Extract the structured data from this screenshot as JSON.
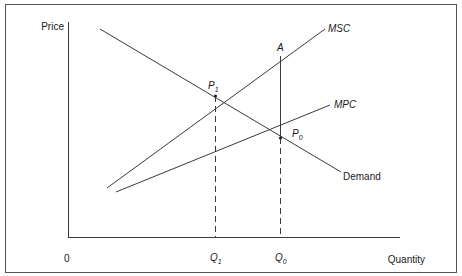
{
  "diagram": {
    "type": "externality-supply-demand",
    "axes": {
      "y_label": "Price",
      "x_label": "Quantity",
      "origin_label": "0"
    },
    "curves": [
      {
        "id": "demand",
        "label": "Demand",
        "italic": false
      },
      {
        "id": "msc",
        "label": "MSC",
        "italic": true
      },
      {
        "id": "mpc",
        "label": "MPC",
        "italic": true
      }
    ],
    "points": {
      "p1": {
        "main": "P",
        "sub": "1",
        "meaning": "intersection of Demand and MSC"
      },
      "p0": {
        "main": "P",
        "sub": "0",
        "meaning": "intersection of Demand and MPC"
      },
      "a": {
        "main": "A",
        "meaning": "point on MSC above Q0"
      }
    },
    "quantities": {
      "q1": {
        "main": "Q",
        "sub": "1"
      },
      "q0": {
        "main": "Q",
        "sub": "0"
      }
    },
    "colors": {
      "line": "#3a3a3a",
      "text": "#1a1a1a",
      "frame": "#555555",
      "background": "#ffffff"
    }
  }
}
